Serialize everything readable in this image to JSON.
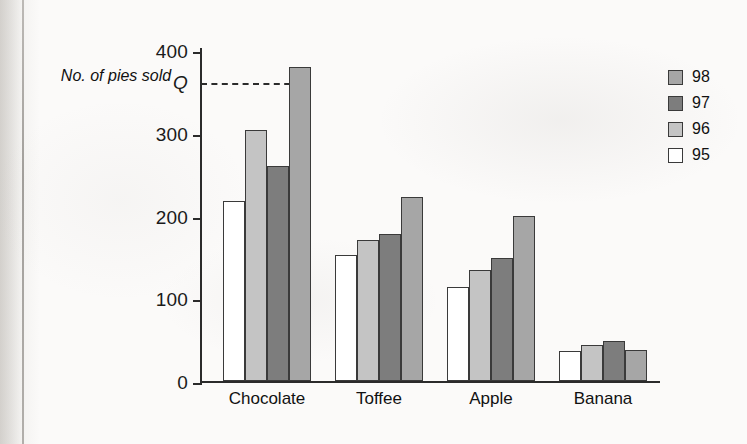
{
  "axis_title": "No. of pies sold",
  "legend": {
    "entries": [
      {
        "label": "98",
        "color": "#a6a6a6"
      },
      {
        "label": "97",
        "color": "#7d7d7d"
      },
      {
        "label": "96",
        "color": "#c4c4c4"
      },
      {
        "label": "95",
        "color": "#ffffff"
      }
    ]
  },
  "chart_data": {
    "type": "bar",
    "title": "",
    "xlabel": "",
    "ylabel": "No. of pies sold",
    "ylim": [
      0,
      400
    ],
    "yticks": [
      0,
      100,
      200,
      300,
      400
    ],
    "grid": false,
    "legend_position": "right",
    "categories": [
      "Chocolate",
      "Toffee",
      "Apple",
      "Banana"
    ],
    "series": [
      {
        "name": "95",
        "color": "#ffffff",
        "values": [
          218,
          152,
          114,
          36
        ]
      },
      {
        "name": "96",
        "color": "#c4c4c4",
        "values": [
          303,
          170,
          134,
          44
        ]
      },
      {
        "name": "97",
        "color": "#7d7d7d",
        "values": [
          260,
          178,
          149,
          48
        ]
      },
      {
        "name": "98",
        "color": "#a6a6a6",
        "values": [
          380,
          222,
          199,
          37
        ]
      }
    ],
    "annotations": [
      {
        "label": "Q",
        "type": "y-reference-line",
        "value": 363,
        "style": "dashed",
        "note": "dashed line from Q on y-axis to top of the 98 Chocolate bar"
      }
    ]
  }
}
